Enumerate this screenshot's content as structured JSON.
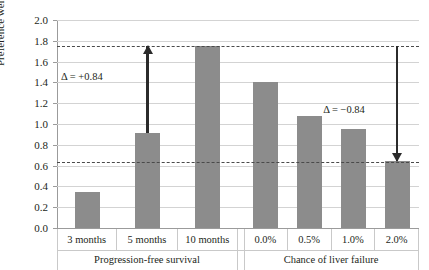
{
  "chart_data": {
    "type": "bar",
    "title": "",
    "xlabel": "",
    "ylabel": "Preference weights",
    "ylim": [
      0.0,
      2.0
    ],
    "ytick_labels": [
      "0.0",
      "0.2",
      "0.4",
      "0.6",
      "0.8",
      "1.0",
      "1.2",
      "1.4",
      "1.6",
      "1.8",
      "2.0"
    ],
    "ytick_values": [
      0.0,
      0.2,
      0.4,
      0.6,
      0.8,
      1.0,
      1.2,
      1.4,
      1.6,
      1.8,
      2.0
    ],
    "grid": true,
    "legend": "none",
    "groups": [
      {
        "name": "Progression-free survival",
        "categories": [
          "3 months",
          "5 months",
          "10 months"
        ],
        "values": [
          0.35,
          0.91,
          1.75
        ]
      },
      {
        "name": "Chance of liver failure",
        "categories": [
          "0.0%",
          "0.5%",
          "1.0%",
          "2.0%"
        ],
        "values": [
          1.4,
          1.08,
          0.95,
          0.64
        ]
      }
    ],
    "categories": [
      "3 months",
      "5 months",
      "10 months",
      "0.0%",
      "0.5%",
      "1.0%",
      "2.0%"
    ],
    "values": [
      0.35,
      0.91,
      1.75,
      1.4,
      1.08,
      0.95,
      0.64
    ],
    "reference_lines": [
      {
        "value": 1.75,
        "style": "dashed"
      },
      {
        "value": 0.63,
        "style": "dashed"
      }
    ],
    "annotations": [
      {
        "text": "Δ = +0.84",
        "group": "Progression-free survival",
        "from": 0.91,
        "to": 1.75,
        "direction": "up"
      },
      {
        "text": "Δ = −0.84",
        "group": "Chance of liver failure",
        "from": 1.48,
        "to": 0.64,
        "direction": "down"
      }
    ],
    "bar_color": "#8c8c8c",
    "grid_color": "#d3d3d3",
    "axis_color": "#9b9b9b",
    "dash_color": "#4a4a4a",
    "arrow_color": "#2b2b2b"
  }
}
